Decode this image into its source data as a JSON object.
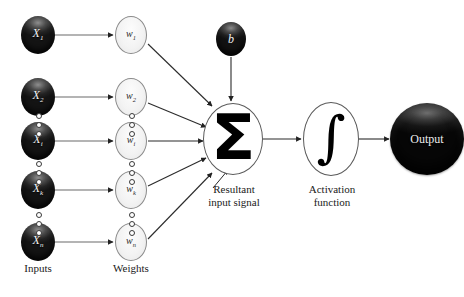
{
  "figure": {
    "type": "diagram",
    "sum_symbol": "Σ",
    "activation_symbol": "∫"
  },
  "captions": {
    "inputs": "Inputs",
    "weights": "Weights",
    "resultant": "Resultant\ninput signal",
    "activation": "Activation\nfunction"
  },
  "inputs": [
    {
      "base": "X",
      "sub": "1"
    },
    {
      "base": "X",
      "sub": "2"
    },
    {
      "base": "X",
      "sub": "i"
    },
    {
      "base": "X",
      "sub": "k"
    },
    {
      "base": "X",
      "sub": "n"
    }
  ],
  "weights": [
    {
      "base": "w",
      "sub": "1"
    },
    {
      "base": "w",
      "sub": "2"
    },
    {
      "base": "w",
      "sub": "i"
    },
    {
      "base": "w",
      "sub": "k"
    },
    {
      "base": "w",
      "sub": "n"
    }
  ],
  "bias": {
    "label": "b"
  },
  "output": {
    "label": "Output"
  },
  "colors": {
    "background": "#ffffff",
    "node_dark": "#191919",
    "node_light": "#f3f3f3",
    "stroke": "#3a3a3a",
    "text_dark": "#1a1a1a",
    "text_light": "#f2f2f2"
  }
}
